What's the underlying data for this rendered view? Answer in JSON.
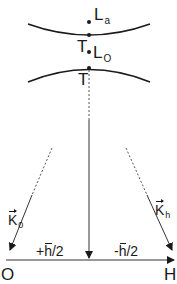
{
  "diagram": {
    "points": {
      "La": {
        "main": "L",
        "sub": "a"
      },
      "Lo": {
        "main": "L",
        "sub": "O"
      },
      "T_upper": "T",
      "T_lower": "T"
    },
    "vectors": {
      "K0": {
        "main": "K",
        "sub": "0"
      },
      "Kh": {
        "main": "K",
        "sub": "h"
      }
    },
    "axis": {
      "origin": "O",
      "end": "H",
      "left_shift": {
        "sign": "+",
        "symbol": "h",
        "tail": "/2"
      },
      "right_shift": {
        "sign": "-",
        "symbol": "h",
        "tail": "/2"
      }
    },
    "colors": {
      "line": "#1a1a1a",
      "dashed": "#555555",
      "background": "#ffffff"
    }
  }
}
